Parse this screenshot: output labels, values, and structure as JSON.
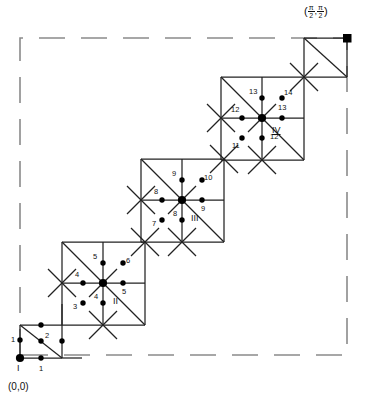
{
  "figure": {
    "title": "",
    "origin_label": "(0,0)",
    "corner_label": {
      "open_paren": "(",
      "x_num": "π",
      "x_den": "2",
      "comma": ",",
      "y_num": "π",
      "y_den": "2",
      "close_paren": ")"
    },
    "domain_border": {
      "style": "dashed",
      "color": "#8a8a8a",
      "x0": 20,
      "y0": 38,
      "x1": 347,
      "y1": 355
    },
    "line_color": "#222222",
    "dot_color": "#000000"
  },
  "cells": [
    {
      "id": "I",
      "roman": "I",
      "center_x": 20,
      "center_y": 358,
      "labels": [
        "1",
        "2",
        "1"
      ],
      "label_left": "1",
      "label_diag": "2",
      "label_bottom": "1"
    },
    {
      "id": "II",
      "roman": "II",
      "center_x": 103,
      "center_y": 283,
      "label_left": "4",
      "label_up": "5",
      "label_right": "5",
      "label_down": "4",
      "label_diag_low": "3",
      "label_diag_high": "6"
    },
    {
      "id": "III",
      "roman": "III",
      "center_x": 182,
      "center_y": 200,
      "label_left": "8",
      "label_up": "9",
      "label_right": "9",
      "label_down": "8",
      "label_diag_low": "7",
      "label_diag_high": "10"
    },
    {
      "id": "IV",
      "roman": "IV",
      "center_x": 262,
      "center_y": 118,
      "label_left": "12",
      "label_up": "13",
      "label_right": "13",
      "label_down": "12",
      "label_diag_low": "11",
      "label_diag_high": "14"
    }
  ],
  "labels_flat": {
    "n1a": "1",
    "n2": "2",
    "n1b": "1",
    "n3": "3",
    "n4a": "4",
    "n4b": "4",
    "n5a": "5",
    "n5b": "5",
    "n6": "6",
    "n7": "7",
    "n8a": "8",
    "n8b": "8",
    "n9a": "9",
    "n9b": "9",
    "n10": "10",
    "n11": "11",
    "n12a": "12",
    "n12b": "12",
    "n13a": "13",
    "n13b": "13",
    "n14": "14",
    "rI": "I",
    "rII": "II",
    "rIII": "III",
    "rIV": "IV"
  }
}
